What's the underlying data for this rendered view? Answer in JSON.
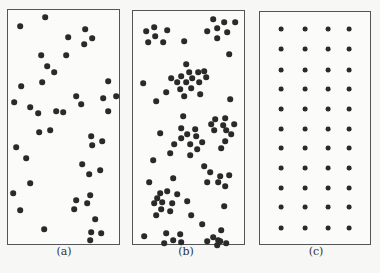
{
  "figure": {
    "panels": [
      {
        "id": "a",
        "label": "(a)",
        "pattern": "random",
        "box": {
          "x": 7,
          "y": 9,
          "w": 113,
          "h": 236
        },
        "label_pos": {
          "x": 64,
          "y": 254
        },
        "dot_radius": 2.8,
        "dots": [
          [
            45,
            17
          ],
          [
            20,
            26
          ],
          [
            85,
            29
          ],
          [
            68,
            37
          ],
          [
            92,
            38
          ],
          [
            84,
            44
          ],
          [
            41,
            55
          ],
          [
            66,
            55
          ],
          [
            47,
            66
          ],
          [
            54,
            72
          ],
          [
            108,
            81
          ],
          [
            42,
            82
          ],
          [
            21,
            86
          ],
          [
            76,
            96
          ],
          [
            103,
            98
          ],
          [
            116,
            96
          ],
          [
            14,
            102
          ],
          [
            81,
            104
          ],
          [
            30,
            107
          ],
          [
            38,
            113
          ],
          [
            56,
            111
          ],
          [
            63,
            112
          ],
          [
            108,
            111
          ],
          [
            39,
            132
          ],
          [
            50,
            130
          ],
          [
            91,
            136
          ],
          [
            102,
            141
          ],
          [
            92,
            145
          ],
          [
            16,
            147
          ],
          [
            26,
            158
          ],
          [
            82,
            164
          ],
          [
            89,
            174
          ],
          [
            100,
            170
          ],
          [
            30,
            183
          ],
          [
            13,
            193
          ],
          [
            76,
            200
          ],
          [
            90,
            195
          ],
          [
            87,
            203
          ],
          [
            20,
            210
          ],
          [
            74,
            209
          ],
          [
            95,
            219
          ],
          [
            44,
            229
          ],
          [
            91,
            232
          ],
          [
            101,
            233
          ],
          [
            90,
            240
          ]
        ]
      },
      {
        "id": "b",
        "label": "(b)",
        "pattern": "clustered",
        "box": {
          "x": 132,
          "y": 10,
          "w": 113,
          "h": 235
        },
        "label_pos": {
          "x": 186,
          "y": 254
        },
        "dot_radius": 2.8,
        "dots": [
          [
            146,
            31
          ],
          [
            154,
            27
          ],
          [
            167,
            30
          ],
          [
            155,
            36
          ],
          [
            148,
            42
          ],
          [
            163,
            42
          ],
          [
            184,
            41
          ],
          [
            213,
            19
          ],
          [
            224,
            22
          ],
          [
            235,
            22
          ],
          [
            207,
            31
          ],
          [
            217,
            28
          ],
          [
            227,
            32
          ],
          [
            217,
            38
          ],
          [
            229,
            54
          ],
          [
            186,
            64
          ],
          [
            189,
            72
          ],
          [
            198,
            72
          ],
          [
            204,
            71
          ],
          [
            171,
            78
          ],
          [
            181,
            76
          ],
          [
            192,
            78
          ],
          [
            206,
            77
          ],
          [
            177,
            82
          ],
          [
            186,
            82
          ],
          [
            199,
            82
          ],
          [
            166,
            92
          ],
          [
            180,
            89
          ],
          [
            191,
            88
          ],
          [
            200,
            94
          ],
          [
            184,
            96
          ],
          [
            143,
            83
          ],
          [
            156,
            101
          ],
          [
            230,
            99
          ],
          [
            183,
            116
          ],
          [
            215,
            119
          ],
          [
            225,
            118
          ],
          [
            211,
            124
          ],
          [
            223,
            125
          ],
          [
            234,
            124
          ],
          [
            214,
            130
          ],
          [
            226,
            130
          ],
          [
            231,
            134
          ],
          [
            225,
            141
          ],
          [
            221,
            148
          ],
          [
            160,
            133
          ],
          [
            181,
            128
          ],
          [
            195,
            129
          ],
          [
            187,
            134
          ],
          [
            181,
            138
          ],
          [
            196,
            136
          ],
          [
            202,
            142
          ],
          [
            174,
            144
          ],
          [
            190,
            144
          ],
          [
            197,
            149
          ],
          [
            170,
            153
          ],
          [
            190,
            155
          ],
          [
            153,
            160
          ],
          [
            204,
            166
          ],
          [
            210,
            172
          ],
          [
            220,
            176
          ],
          [
            229,
            175
          ],
          [
            207,
            182
          ],
          [
            218,
            182
          ],
          [
            225,
            186
          ],
          [
            149,
            182
          ],
          [
            173,
            178
          ],
          [
            160,
            193
          ],
          [
            167,
            191
          ],
          [
            177,
            194
          ],
          [
            157,
            198
          ],
          [
            154,
            203
          ],
          [
            162,
            202
          ],
          [
            172,
            203
          ],
          [
            161,
            209
          ],
          [
            170,
            211
          ],
          [
            156,
            215
          ],
          [
            187,
            201
          ],
          [
            191,
            215
          ],
          [
            224,
            206
          ],
          [
            202,
            224
          ],
          [
            144,
            236
          ],
          [
            166,
            233
          ],
          [
            180,
            234
          ],
          [
            173,
            240
          ],
          [
            164,
            243
          ],
          [
            181,
            242
          ],
          [
            207,
            241
          ],
          [
            213,
            237
          ],
          [
            218,
            240
          ],
          [
            217,
            245
          ],
          [
            221,
            230
          ],
          [
            220,
            241
          ],
          [
            226,
            243
          ]
        ]
      },
      {
        "id": "c",
        "label": "(c)",
        "pattern": "uniform",
        "box": {
          "x": 259,
          "y": 11,
          "w": 112,
          "h": 234
        },
        "label_pos": {
          "x": 316,
          "y": 254
        },
        "dot_radius": 2.4,
        "grid": {
          "cols": [
            281,
            305,
            328,
            349
          ],
          "rows": [
            29,
            49,
            70,
            89,
            109,
            129,
            148,
            168,
            188,
            207,
            228
          ]
        }
      }
    ],
    "colors": {
      "dot": "#2a2a2a",
      "border": "#555555",
      "background": "#fbfbfa"
    }
  }
}
